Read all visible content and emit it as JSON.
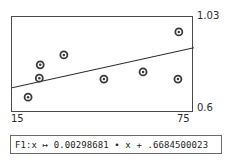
{
  "chart_data": {
    "type": "scatter",
    "title": "",
    "subtitle": "",
    "xlabel": "",
    "ylabel": "",
    "xlim": [
      15,
      75
    ],
    "ylim": [
      0.6,
      1.03
    ],
    "grid": false,
    "legend": null,
    "x_tick_labels": [
      "15",
      "75"
    ],
    "y_tick_labels": [
      "0.6",
      "1.03"
    ],
    "marker_style": "open-circle-with-center-dot",
    "marker_color": "#3a3a3a",
    "points": [
      {
        "x": 20.3,
        "y": 0.671
      },
      {
        "x": 24.0,
        "y": 0.756
      },
      {
        "x": 24.3,
        "y": 0.816
      },
      {
        "x": 32.1,
        "y": 0.86
      },
      {
        "x": 45.3,
        "y": 0.752
      },
      {
        "x": 58.2,
        "y": 0.784
      },
      {
        "x": 70.0,
        "y": 0.963
      },
      {
        "x": 69.7,
        "y": 0.752
      }
    ],
    "fit_line": {
      "type": "line",
      "label": "F1",
      "slope": 0.00298681,
      "intercept": 0.6684500023,
      "x_start": 15,
      "x_end": 75,
      "y_start": 0.7132,
      "y_end": 0.8925,
      "color": "#2b2b2b"
    },
    "annotations": []
  },
  "axes": {
    "y_max": "1.03",
    "y_min": "0.6",
    "x_min": "15",
    "x_max": "75"
  },
  "formula_bar": {
    "text": "F1:x ↦ 0.00298681 • x + .6684500023"
  }
}
